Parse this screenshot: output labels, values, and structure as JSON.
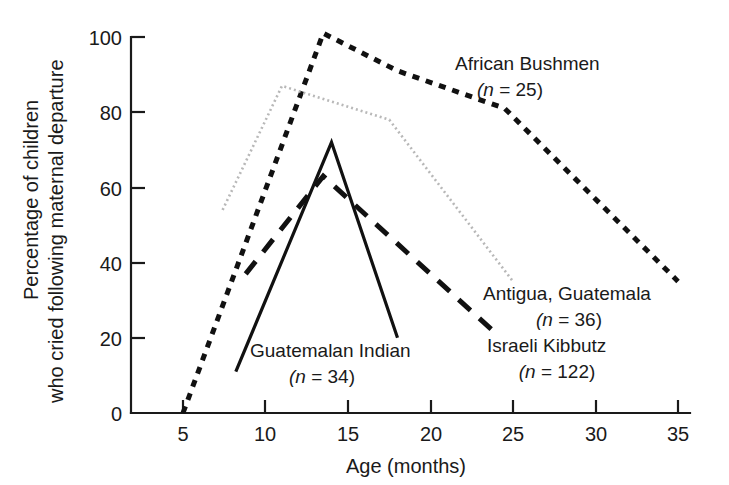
{
  "chart_data": {
    "type": "line",
    "title": "",
    "xlabel": "Age (months)",
    "ylabel": "Percentage of children\nwho cried following maternal departure",
    "ylabel_line1": "Percentage of children",
    "ylabel_line2": "who cried following maternal departure",
    "xlim": [
      0,
      36
    ],
    "ylim": [
      0,
      100
    ],
    "xticks": [
      5,
      10,
      15,
      20,
      25,
      30,
      35
    ],
    "xtick_labels": [
      "5",
      "10",
      "15",
      "20",
      "25",
      "30",
      "35"
    ],
    "yticks": [
      0,
      20,
      40,
      60,
      80,
      100
    ],
    "ytick_labels": [
      "0",
      "20",
      "40",
      "60",
      "80",
      "100"
    ],
    "grid": false,
    "legend_position": "inline-annotations",
    "series": [
      {
        "name": "African Bushmen",
        "n": 25,
        "label_line1": "African Bushmen",
        "label_line2": "(n = 25)",
        "style": "short-dash",
        "color": "#111111",
        "x": [
          5,
          13.5,
          18,
          24.5,
          35
        ],
        "y": [
          0,
          101,
          91,
          81,
          35
        ]
      },
      {
        "name": "Antigua, Guatemala",
        "n": 36,
        "label_line1": "Antigua, Guatemala",
        "label_line2": "(n = 36)",
        "style": "dotted",
        "color": "#b8b8b8",
        "x": [
          7.4,
          11,
          17.5,
          25
        ],
        "y": [
          54,
          87,
          78,
          35
        ]
      },
      {
        "name": "Israeli Kibbutz",
        "n": 122,
        "label_line1": "Israeli Kibbutz",
        "label_line2": "(n = 122)",
        "style": "long-dash",
        "color": "#111111",
        "x": [
          8.8,
          13.5,
          24
        ],
        "y": [
          37,
          63,
          21
        ]
      },
      {
        "name": "Guatemalan Indian",
        "n": 34,
        "label_line1": "Guatemalan Indian",
        "label_line2": "(n = 34)",
        "style": "solid",
        "color": "#111111",
        "x": [
          8.2,
          14,
          18
        ],
        "y": [
          11,
          72,
          20
        ]
      }
    ],
    "annotations": [
      {
        "text": "African Bushmen",
        "x": 21.5,
        "y": 90
      },
      {
        "text": "(n = 25)",
        "x": 21.5,
        "y": 81
      },
      {
        "text": "Antigua, Guatemala",
        "x": 27.5,
        "y": 28
      },
      {
        "text": "(n = 36)",
        "x": 27.5,
        "y": 20
      },
      {
        "text": "Israeli Kibbutz",
        "x": 25.5,
        "y": 14
      },
      {
        "text": "(n = 122)",
        "x": 25.5,
        "y": 6
      },
      {
        "text": "Guatemalan Indian",
        "x": 14.5,
        "y": 13
      },
      {
        "text": "(n = 34)",
        "x": 14.5,
        "y": 5
      }
    ]
  }
}
